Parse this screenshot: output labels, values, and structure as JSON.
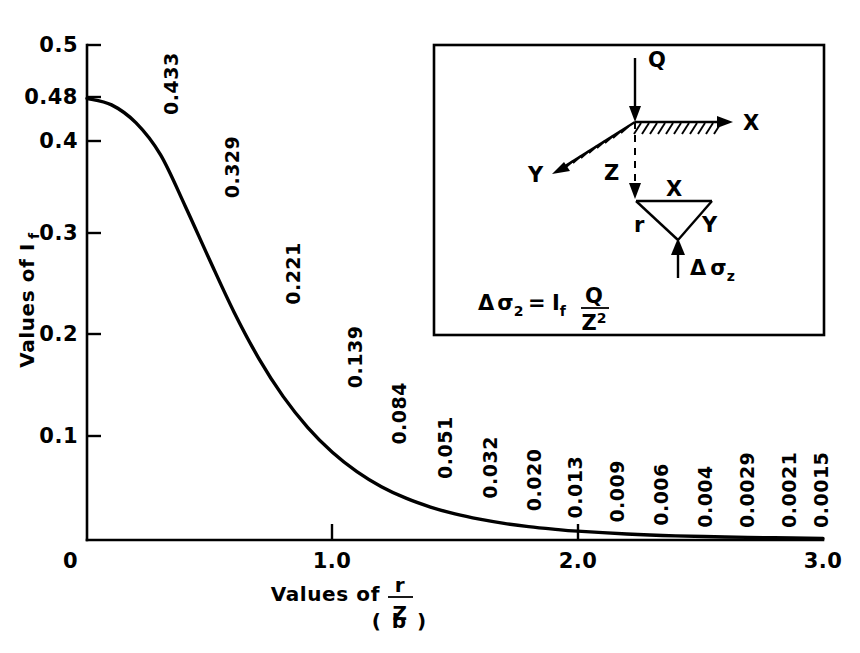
{
  "caption": "( b )",
  "axes": {
    "ylabel_prefix": "Values of I",
    "ylabel_sub": "f",
    "xlabel_prefix": "Values of",
    "xlabel_num": "r",
    "xlabel_den": "Z",
    "y_ticks": [
      "0.5",
      "0.48",
      "0.4",
      "0.3",
      "0.2",
      "0.1",
      "0"
    ],
    "x_ticks": [
      "0",
      "1.0",
      "2.0",
      "3.0"
    ]
  },
  "inset": {
    "load_label": "Q",
    "axis_x_label": "X",
    "axis_y_label": "Y",
    "depth_label": "Z",
    "tri_top_label": "X",
    "tri_right_label": "Y",
    "tri_left_label": "r",
    "stress_delta": "Δ",
    "stress_sigma": "σ",
    "stress_sub": "z",
    "formula_delta": "Δ",
    "formula_sigma": "σ",
    "formula_sigma_sub": "2",
    "formula_eq": "=",
    "formula_i": "I",
    "formula_i_sub": "f",
    "formula_num": "Q",
    "formula_den": "Z",
    "formula_den_sup": "2"
  },
  "chart_data": {
    "type": "line",
    "title": "( b )",
    "xlabel": "Values of r/Z",
    "ylabel": "Values of I_f",
    "xlim": [
      0,
      3.0
    ],
    "ylim": [
      0,
      0.5
    ],
    "grid": false,
    "legend": null,
    "y_axis_note": "non-linear axis: compressed between 0.4 and 0.5 with extra tick at 0.48",
    "y_tick_values": [
      0.5,
      0.48,
      0.4,
      0.3,
      0.2,
      0.1,
      0
    ],
    "x_tick_values": [
      0,
      1.0,
      2.0,
      3.0
    ],
    "annotated_points": [
      {
        "x": 0.3,
        "label": "0.433",
        "y": 0.433
      },
      {
        "x": 0.55,
        "label": "0.329",
        "y": 0.329
      },
      {
        "x": 0.8,
        "label": "0.221",
        "y": 0.221
      },
      {
        "x": 1.05,
        "label": "0.139",
        "y": 0.139
      },
      {
        "x": 1.23,
        "label": "0.084",
        "y": 0.084
      },
      {
        "x": 1.42,
        "label": "0.051",
        "y": 0.051
      },
      {
        "x": 1.6,
        "label": "0.032",
        "y": 0.032
      },
      {
        "x": 1.78,
        "label": "0.020",
        "y": 0.02
      },
      {
        "x": 1.95,
        "label": "0.013",
        "y": 0.013
      },
      {
        "x": 2.12,
        "label": "0.009",
        "y": 0.009
      },
      {
        "x": 2.3,
        "label": "0.006",
        "y": 0.006
      },
      {
        "x": 2.48,
        "label": "0.004",
        "y": 0.004
      },
      {
        "x": 2.65,
        "label": "0.0029",
        "y": 0.0029
      },
      {
        "x": 2.82,
        "label": "0.0021",
        "y": 0.0021
      },
      {
        "x": 2.95,
        "label": "0.0015",
        "y": 0.0015
      }
    ],
    "curve": {
      "x": [
        0,
        0.1,
        0.2,
        0.3,
        0.4,
        0.5,
        0.6,
        0.7,
        0.8,
        0.9,
        1.0,
        1.1,
        1.2,
        1.3,
        1.4,
        1.5,
        1.6,
        1.7,
        1.8,
        1.9,
        2.0,
        2.2,
        2.4,
        2.6,
        2.8,
        3.0
      ],
      "y": [
        0.4775,
        0.4657,
        0.4329,
        0.3849,
        0.3294,
        0.2733,
        0.2214,
        0.1762,
        0.1386,
        0.1083,
        0.0844,
        0.0658,
        0.0513,
        0.0402,
        0.0317,
        0.0251,
        0.02,
        0.016,
        0.0129,
        0.0105,
        0.0085,
        0.0058,
        0.004,
        0.0029,
        0.0021,
        0.0015
      ]
    }
  }
}
